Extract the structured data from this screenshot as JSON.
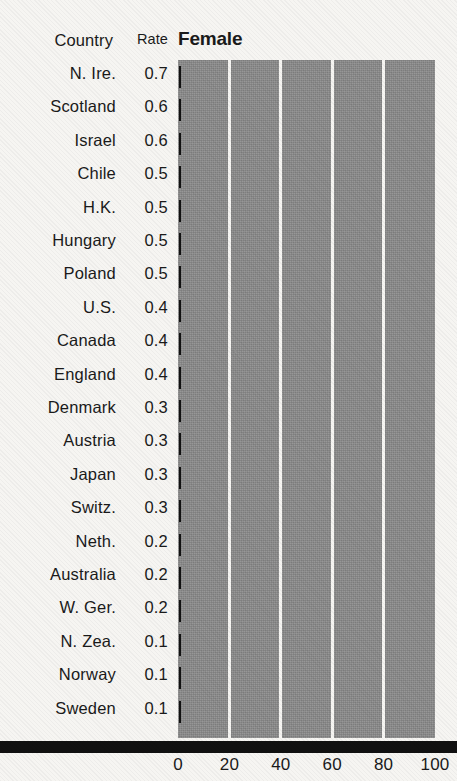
{
  "table": {
    "header": {
      "country": "Country",
      "rate": "Rate"
    },
    "rows": [
      {
        "country": "N. Ire.",
        "rate": "0.7"
      },
      {
        "country": "Scotland",
        "rate": "0.6"
      },
      {
        "country": "Israel",
        "rate": "0.6"
      },
      {
        "country": "Chile",
        "rate": "0.5"
      },
      {
        "country": "H.K.",
        "rate": "0.5"
      },
      {
        "country": "Hungary",
        "rate": "0.5"
      },
      {
        "country": "Poland",
        "rate": "0.5"
      },
      {
        "country": "U.S.",
        "rate": "0.4"
      },
      {
        "country": "Canada",
        "rate": "0.4"
      },
      {
        "country": "England",
        "rate": "0.4"
      },
      {
        "country": "Denmark",
        "rate": "0.3"
      },
      {
        "country": "Austria",
        "rate": "0.3"
      },
      {
        "country": "Japan",
        "rate": "0.3"
      },
      {
        "country": "Switz.",
        "rate": "0.3"
      },
      {
        "country": "Neth.",
        "rate": "0.2"
      },
      {
        "country": "Australia",
        "rate": "0.2"
      },
      {
        "country": "W. Ger.",
        "rate": "0.2"
      },
      {
        "country": "N. Zea.",
        "rate": "0.1"
      },
      {
        "country": "Norway",
        "rate": "0.1"
      },
      {
        "country": "Sweden",
        "rate": "0.1"
      }
    ]
  },
  "colors": {
    "page_background": "#f6f5f2",
    "plot_fill": "#8b8b8b",
    "gridline": "#f6f5f2",
    "bar": "#111111",
    "axis": "#111111",
    "text": "#1a1a1a"
  },
  "chart_data": {
    "type": "bar",
    "title": "Female",
    "xlabel": "",
    "ylabel": "",
    "orientation": "horizontal",
    "xlim": [
      0,
      100
    ],
    "xticks": [
      0,
      20,
      40,
      60,
      80,
      100
    ],
    "xticklabels": [
      "0",
      "20",
      "40",
      "60",
      "80",
      "100"
    ],
    "grid": true,
    "grid_axis": "x",
    "legend": null,
    "categories": [
      "N. Ire.",
      "Scotland",
      "Israel",
      "Chile",
      "H.K.",
      "Hungary",
      "Poland",
      "U.S.",
      "Canada",
      "England",
      "Denmark",
      "Austria",
      "Japan",
      "Switz.",
      "Neth.",
      "Australia",
      "W. Ger.",
      "N. Zea.",
      "Norway",
      "Sweden"
    ],
    "values": [
      0.7,
      0.6,
      0.6,
      0.5,
      0.5,
      0.5,
      0.5,
      0.4,
      0.4,
      0.4,
      0.3,
      0.3,
      0.3,
      0.3,
      0.2,
      0.2,
      0.2,
      0.1,
      0.1,
      0.1
    ],
    "value_labels": [
      "0.7",
      "0.6",
      "0.6",
      "0.5",
      "0.5",
      "0.5",
      "0.5",
      "0.4",
      "0.4",
      "0.4",
      "0.3",
      "0.3",
      "0.3",
      "0.3",
      "0.2",
      "0.2",
      "0.2",
      "0.1",
      "0.1",
      "0.1"
    ]
  }
}
